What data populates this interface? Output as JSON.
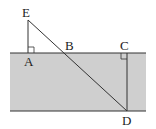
{
  "diagram": {
    "title": "",
    "colors": {
      "band_fill": "#cfcfcf",
      "line": "#333333",
      "background": "#ffffff"
    },
    "points": {
      "E": {
        "label": "E",
        "x": 28,
        "y": 20
      },
      "A": {
        "label": "A",
        "x": 28,
        "y": 53
      },
      "B": {
        "label": "B",
        "x": 64,
        "y": 53
      },
      "C": {
        "label": "C",
        "x": 127,
        "y": 53
      },
      "D": {
        "label": "D",
        "x": 127,
        "y": 111
      }
    },
    "segments": [
      [
        "E",
        "A"
      ],
      [
        "E",
        "D"
      ],
      [
        "C",
        "D"
      ]
    ],
    "right_angles": [
      "A",
      "C"
    ],
    "band": {
      "x1": 10,
      "y1": 53,
      "x2": 146,
      "y2": 111
    }
  }
}
